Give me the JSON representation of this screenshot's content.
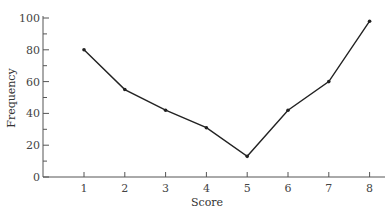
{
  "chart_data": {
    "type": "line",
    "title": "",
    "xlabel": "Score",
    "ylabel": "Frequency",
    "x": [
      1,
      2,
      3,
      4,
      5,
      6,
      7,
      8
    ],
    "categories": [
      "1",
      "2",
      "3",
      "4",
      "5",
      "6",
      "7",
      "8"
    ],
    "values": [
      80,
      55,
      42,
      31,
      13,
      42,
      60,
      98
    ],
    "series": [
      {
        "name": "Frequency",
        "values": [
          80,
          55,
          42,
          31,
          13,
          42,
          60,
          98
        ]
      }
    ],
    "ylim": [
      0,
      100
    ],
    "xlim": [
      0,
      8.4
    ],
    "y_ticks": [
      0,
      20,
      40,
      60,
      80,
      100
    ],
    "y_minor_tick_step": 10,
    "x_ticks": [
      1,
      2,
      3,
      4,
      5,
      6,
      7,
      8
    ],
    "grid": false,
    "legend": "none",
    "marker": "dot",
    "line_color": "#222222"
  }
}
